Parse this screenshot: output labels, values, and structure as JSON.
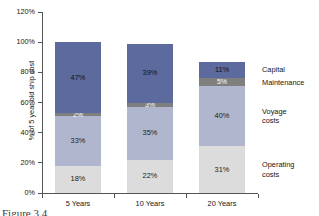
{
  "chart_data": {
    "type": "bar",
    "title": "",
    "subtitle": "",
    "xlabel": "",
    "ylabel": "% of 5 year old ship cost",
    "categories": [
      "5 Years",
      "10 Years",
      "20 Years"
    ],
    "ylim": [
      0,
      120
    ],
    "yticks": [
      "0%",
      "20%",
      "40%",
      "60%",
      "80%",
      "100%",
      "120%"
    ],
    "ytick_values": [
      0,
      20,
      40,
      60,
      80,
      100,
      120
    ],
    "grid": false,
    "stacked": true,
    "legend_position": "right",
    "series": [
      {
        "name": "Capital",
        "color": "#5C6A9E",
        "values": [
          47,
          39,
          11
        ],
        "labels": [
          "47%",
          "39%",
          "11%"
        ]
      },
      {
        "name": "Maintenance",
        "color": "#7F7F7F",
        "values": [
          2,
          3,
          5
        ],
        "labels": [
          "2%",
          "3%",
          "5%"
        ]
      },
      {
        "name": "Voyage costs",
        "color": "#B0B6CE",
        "values": [
          33,
          35,
          40
        ],
        "labels": [
          "33%",
          "35%",
          "40%"
        ]
      },
      {
        "name": "Operating costs",
        "color": "#DCDCDC",
        "values": [
          18,
          22,
          31
        ],
        "labels": [
          "18%",
          "22%",
          "31%"
        ]
      }
    ],
    "totals": [
      100,
      99,
      87
    ],
    "stack_order_bottom_to_top": [
      "Operating costs",
      "Voyage costs",
      "Maintenance",
      "Capital"
    ]
  },
  "legend": {
    "entries": [
      {
        "line1": "Capital",
        "line2": ""
      },
      {
        "line1": "Maintenance",
        "line2": ""
      },
      {
        "line1": "Voyage",
        "line2": "costs"
      },
      {
        "line1": "Operating",
        "line2": "costs"
      }
    ]
  },
  "caption": {
    "text": "Figure 3.4"
  }
}
